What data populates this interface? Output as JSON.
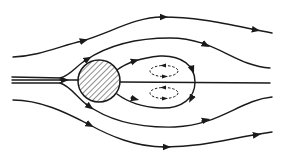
{
  "diagram": {
    "colors": {
      "background": "#ffffff",
      "stroke": "#1a1a1a",
      "hatch": "#333333"
    },
    "elements": {
      "cylinder": {
        "cx": 99,
        "cy": 81,
        "r": 21,
        "fill": "diagonal-hatch"
      },
      "streamlines": [
        {
          "name": "outer-top",
          "arrows": 3
        },
        {
          "name": "inner-top",
          "arrows": 2
        },
        {
          "name": "centerline",
          "arrows": 1
        },
        {
          "name": "inner-bottom",
          "arrows": 2
        },
        {
          "name": "outer-bottom",
          "arrows": 3
        }
      ],
      "wake_bubble": {
        "arrows": 4
      },
      "vortices": [
        {
          "name": "upper-vortex",
          "style": "dashed",
          "cx": 164,
          "cy": 71
        },
        {
          "name": "lower-vortex",
          "style": "dashed",
          "cx": 164,
          "cy": 93
        }
      ]
    }
  }
}
